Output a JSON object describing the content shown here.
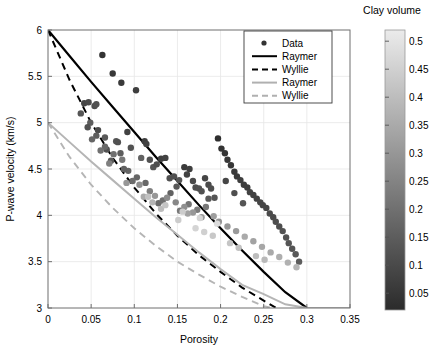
{
  "chart_data": {
    "type": "scatter",
    "title": "",
    "xlabel": "Porosity",
    "ylabel": "P-wave velocity (km/s)",
    "xlim": [
      0,
      0.35
    ],
    "ylim": [
      3,
      6
    ],
    "xticks": [
      0,
      0.05,
      0.1,
      0.15,
      0.2,
      0.25,
      0.3,
      0.35
    ],
    "xticklabels": [
      "0",
      "0.05",
      "0.1",
      "0.15",
      "0.2",
      "0.25",
      "0.3",
      "0.35"
    ],
    "yticks": [
      3,
      3.5,
      4,
      4.5,
      5,
      5.5,
      6
    ],
    "yticklabels": [
      "3",
      "3.5",
      "4",
      "4.5",
      "5",
      "5.5",
      "6"
    ],
    "grid": true,
    "legend_position": "top-right",
    "legend": [
      {
        "label": "Data",
        "marker": "circle",
        "color": "#333333",
        "style": "marker"
      },
      {
        "label": "Raymer",
        "marker": "line",
        "color": "#000000",
        "style": "solid"
      },
      {
        "label": "Wyllie",
        "marker": "line",
        "color": "#000000",
        "style": "dashed"
      },
      {
        "label": "Raymer",
        "marker": "line",
        "color": "#b0b0b0",
        "style": "solid"
      },
      {
        "label": "Wyllie",
        "marker": "line",
        "color": "#b0b0b0",
        "style": "dashed"
      }
    ],
    "colorbar": {
      "title": "Clay volume",
      "ticks": [
        0.05,
        0.1,
        0.15,
        0.2,
        0.25,
        0.3,
        0.35,
        0.4,
        0.45,
        0.5
      ],
      "ticklabels": [
        "0.05",
        "0.1",
        "0.15",
        "0.2",
        "0.25",
        "0.3",
        "0.35",
        "0.4",
        "0.45",
        "0.5"
      ],
      "vmin": 0.02,
      "vmax": 0.52,
      "colormap": "gray",
      "orientation": "vertical",
      "low_color": "#2b2b2b",
      "high_color": "#ebebeb"
    },
    "series": [
      {
        "name": "Raymer black",
        "style": "solid",
        "color": "#000000",
        "width": 2.2,
        "points": [
          [
            0,
            6
          ],
          [
            0.025,
            5.72
          ],
          [
            0.05,
            5.44
          ],
          [
            0.075,
            5.17
          ],
          [
            0.1,
            4.9
          ],
          [
            0.125,
            4.63
          ],
          [
            0.15,
            4.37
          ],
          [
            0.175,
            4.11
          ],
          [
            0.2,
            3.86
          ],
          [
            0.225,
            3.62
          ],
          [
            0.25,
            3.39
          ],
          [
            0.275,
            3.17
          ],
          [
            0.3,
            3.0
          ],
          [
            0.325,
            3.0
          ],
          [
            0.35,
            3.0
          ]
        ]
      },
      {
        "name": "Wyllie black",
        "style": "dashed",
        "color": "#000000",
        "width": 2.0,
        "points": [
          [
            0,
            6
          ],
          [
            0.025,
            5.46
          ],
          [
            0.05,
            5.0
          ],
          [
            0.075,
            4.62
          ],
          [
            0.1,
            4.3
          ],
          [
            0.125,
            4.02
          ],
          [
            0.15,
            3.78
          ],
          [
            0.175,
            3.57
          ],
          [
            0.2,
            3.39
          ],
          [
            0.225,
            3.22
          ],
          [
            0.25,
            3.08
          ],
          [
            0.27,
            2.97
          ],
          [
            0.35,
            2.97
          ]
        ]
      },
      {
        "name": "Raymer gray",
        "style": "solid",
        "color": "#b5b5b5",
        "width": 2.0,
        "points": [
          [
            0,
            5.0
          ],
          [
            0.025,
            4.79
          ],
          [
            0.05,
            4.58
          ],
          [
            0.075,
            4.38
          ],
          [
            0.1,
            4.18
          ],
          [
            0.125,
            3.98
          ],
          [
            0.15,
            3.79
          ],
          [
            0.175,
            3.6
          ],
          [
            0.2,
            3.42
          ],
          [
            0.225,
            3.25
          ],
          [
            0.25,
            3.15
          ],
          [
            0.275,
            3.04
          ],
          [
            0.3,
            3.0
          ],
          [
            0.35,
            3.0
          ]
        ]
      },
      {
        "name": "Wyllie gray",
        "style": "dashed",
        "color": "#b5b5b5",
        "width": 1.9,
        "points": [
          [
            0,
            5.0
          ],
          [
            0.025,
            4.63
          ],
          [
            0.05,
            4.33
          ],
          [
            0.075,
            4.08
          ],
          [
            0.1,
            3.86
          ],
          [
            0.125,
            3.67
          ],
          [
            0.15,
            3.5
          ],
          [
            0.175,
            3.36
          ],
          [
            0.2,
            3.23
          ],
          [
            0.225,
            3.12
          ],
          [
            0.25,
            3.02
          ],
          [
            0.275,
            2.97
          ],
          [
            0.35,
            2.97
          ]
        ]
      }
    ],
    "scatter": {
      "name": "Data",
      "marker_size": 6.4,
      "x": [
        0.063,
        0.075,
        0.085,
        0.102,
        0.042,
        0.047,
        0.054,
        0.056,
        0.038,
        0.049,
        0.066,
        0.079,
        0.081,
        0.084,
        0.092,
        0.096,
        0.108,
        0.112,
        0.114,
        0.118,
        0.122,
        0.126,
        0.131,
        0.136,
        0.141,
        0.146,
        0.149,
        0.152,
        0.158,
        0.161,
        0.164,
        0.168,
        0.171,
        0.175,
        0.178,
        0.182,
        0.186,
        0.189,
        0.193,
        0.197,
        0.201,
        0.205,
        0.208,
        0.212,
        0.216,
        0.219,
        0.223,
        0.227,
        0.231,
        0.234,
        0.238,
        0.242,
        0.246,
        0.249,
        0.253,
        0.257,
        0.261,
        0.264,
        0.268,
        0.272,
        0.276,
        0.279,
        0.283,
        0.287,
        0.291,
        0.206,
        0.216,
        0.226,
        0.186,
        0.142,
        0.128,
        0.103,
        0.113,
        0.133,
        0.153,
        0.163,
        0.173,
        0.183,
        0.093,
        0.073,
        0.058,
        0.068,
        0.088,
        0.098,
        0.118,
        0.138,
        0.148,
        0.158,
        0.168,
        0.178,
        0.198,
        0.208,
        0.218,
        0.238,
        0.248,
        0.258,
        0.268,
        0.278,
        0.288,
        0.228,
        0.192,
        0.162,
        0.124,
        0.106,
        0.086,
        0.076,
        0.066,
        0.056,
        0.046,
        0.051,
        0.061,
        0.071,
        0.091,
        0.111,
        0.121,
        0.131,
        0.151,
        0.171,
        0.181,
        0.191,
        0.211,
        0.221,
        0.241,
        0.251,
        0.196,
        0.176,
        0.156,
        0.136,
        0.116
      ],
      "y": [
        5.73,
        5.53,
        5.43,
        5.35,
        5.21,
        5.22,
        5.18,
        5.2,
        5.1,
        5.0,
        4.84,
        4.8,
        4.79,
        4.67,
        4.9,
        4.73,
        4.62,
        4.8,
        4.77,
        4.6,
        4.52,
        4.55,
        4.61,
        4.62,
        4.4,
        4.42,
        4.31,
        4.38,
        4.52,
        4.44,
        4.5,
        4.37,
        4.3,
        4.29,
        4.26,
        4.4,
        4.33,
        4.29,
        4.19,
        4.83,
        4.72,
        4.67,
        4.6,
        4.54,
        4.47,
        4.42,
        4.38,
        4.33,
        4.3,
        4.25,
        4.22,
        4.18,
        4.14,
        4.11,
        4.08,
        4.02,
        3.98,
        3.93,
        3.88,
        3.83,
        3.76,
        3.7,
        3.64,
        3.58,
        3.5,
        4.37,
        4.24,
        4.13,
        4.18,
        4.24,
        4.13,
        4.41,
        4.35,
        4.16,
        4.05,
        4.12,
        4.06,
        4.09,
        4.48,
        4.59,
        4.92,
        4.71,
        4.5,
        4.37,
        4.26,
        4.19,
        4.14,
        4.09,
        4.03,
        3.98,
        3.93,
        3.88,
        3.83,
        3.72,
        3.66,
        3.6,
        3.55,
        3.49,
        3.44,
        3.77,
        3.99,
        4.02,
        4.21,
        4.33,
        4.6,
        4.66,
        4.74,
        4.86,
        4.95,
        4.82,
        4.7,
        4.56,
        4.35,
        4.2,
        4.14,
        4.07,
        3.95,
        3.86,
        3.82,
        3.78,
        3.7,
        3.65,
        3.56,
        3.52,
        3.91,
        3.97,
        4.04,
        4.11,
        4.2
      ],
      "c": [
        0.04,
        0.05,
        0.06,
        0.07,
        0.09,
        0.1,
        0.11,
        0.12,
        0.13,
        0.15,
        0.14,
        0.13,
        0.12,
        0.15,
        0.08,
        0.12,
        0.16,
        0.07,
        0.08,
        0.12,
        0.13,
        0.11,
        0.07,
        0.08,
        0.12,
        0.12,
        0.14,
        0.13,
        0.06,
        0.08,
        0.07,
        0.1,
        0.11,
        0.12,
        0.12,
        0.09,
        0.1,
        0.11,
        0.13,
        0.03,
        0.04,
        0.04,
        0.05,
        0.05,
        0.06,
        0.06,
        0.07,
        0.07,
        0.07,
        0.08,
        0.08,
        0.08,
        0.09,
        0.09,
        0.09,
        0.1,
        0.1,
        0.11,
        0.11,
        0.12,
        0.12,
        0.13,
        0.13,
        0.14,
        0.15,
        0.09,
        0.11,
        0.13,
        0.14,
        0.16,
        0.19,
        0.17,
        0.18,
        0.2,
        0.22,
        0.21,
        0.23,
        0.22,
        0.17,
        0.14,
        0.1,
        0.12,
        0.16,
        0.19,
        0.24,
        0.27,
        0.26,
        0.28,
        0.3,
        0.31,
        0.29,
        0.3,
        0.31,
        0.33,
        0.34,
        0.35,
        0.36,
        0.37,
        0.38,
        0.35,
        0.32,
        0.33,
        0.3,
        0.28,
        0.22,
        0.2,
        0.18,
        0.15,
        0.12,
        0.17,
        0.2,
        0.24,
        0.3,
        0.35,
        0.38,
        0.4,
        0.44,
        0.46,
        0.45,
        0.43,
        0.42,
        0.41,
        0.4,
        0.39,
        0.48,
        0.46,
        0.44,
        0.42,
        0.41
      ]
    }
  }
}
